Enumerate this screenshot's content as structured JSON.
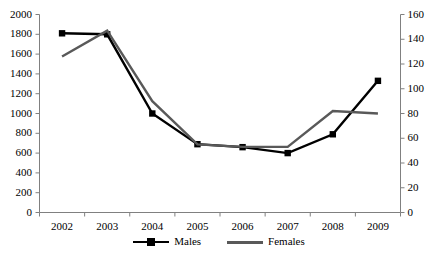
{
  "chart_data": {
    "type": "line",
    "title": "",
    "subtitle": "",
    "xlabel": "",
    "ylabel": "",
    "grid": false,
    "legend_position": "bottom",
    "categories": [
      "2002",
      "2003",
      "2004",
      "2005",
      "2006",
      "2007",
      "2008",
      "2009"
    ],
    "axes": {
      "x": {
        "tick_labels": [
          "2002",
          "2003",
          "2004",
          "2005",
          "2006",
          "2007",
          "2008",
          "2009"
        ]
      },
      "y_left": {
        "label": "",
        "min": 0,
        "max": 2000,
        "step": 200,
        "tick_labels": [
          "0",
          "200",
          "400",
          "600",
          "800",
          "1000",
          "1200",
          "1400",
          "1600",
          "1800",
          "2000"
        ]
      },
      "y_right": {
        "label": "",
        "min": 0,
        "max": 160,
        "step": 20,
        "tick_labels": [
          "0",
          "20",
          "40",
          "60",
          "80",
          "100",
          "120",
          "140",
          "160"
        ]
      }
    },
    "series": [
      {
        "name": "Males",
        "axis": "y_left",
        "color": "#000000",
        "marker": "square",
        "values": [
          1810,
          1800,
          1000,
          690,
          660,
          600,
          790,
          1330
        ]
      },
      {
        "name": "Females",
        "axis": "y_right",
        "color": "#595959",
        "marker": "none",
        "values": [
          126,
          147,
          90,
          55,
          53,
          53,
          82,
          80
        ]
      }
    ]
  },
  "legend": {
    "items": [
      {
        "label": "Males"
      },
      {
        "label": "Females"
      }
    ]
  },
  "colors": {
    "males": "#000000",
    "females": "#595959",
    "axis": "#808080",
    "background": "#ffffff"
  }
}
